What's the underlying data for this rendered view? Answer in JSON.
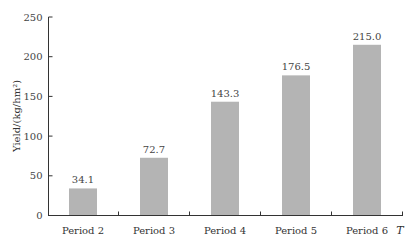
{
  "chart_data": {
    "type": "bar",
    "title": "",
    "xlabel": "T",
    "ylabel": "Yield/(kg/hm²)",
    "categories": [
      "Period 2",
      "Period 3",
      "Period 4",
      "Period 5",
      "Period 6"
    ],
    "values": [
      34.1,
      72.7,
      143.3,
      176.5,
      215.0
    ],
    "value_labels": [
      "34.1",
      "72.7",
      "143.3",
      "176.5",
      "215.0"
    ],
    "ylim": [
      0,
      250
    ],
    "yticks": [
      0,
      50,
      100,
      150,
      200,
      250
    ],
    "grid": false,
    "legend": null,
    "bar_color": "#b4b4b4"
  }
}
